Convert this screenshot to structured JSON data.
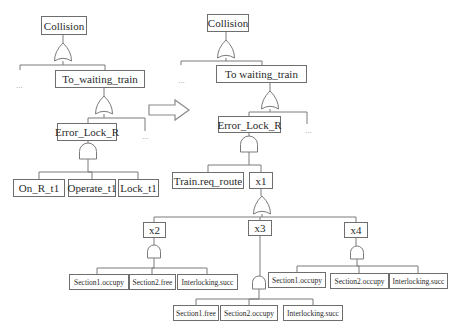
{
  "diagram": {
    "type": "fault-tree",
    "left_tree": {
      "top_event": "Collision",
      "intermediate_event": "To_waiting_train",
      "sub_event": "Error_Lock_R",
      "basic_events": [
        "On_R_t1",
        "Operate_t1",
        "Lock_t1"
      ],
      "ellipsis": "..."
    },
    "transform_arrow": "right-arrow",
    "right_tree": {
      "top_event": "Collision",
      "intermediate_event": "To waiting_train",
      "sub_event": "Error_Lock_R",
      "inputs": [
        "Train.req_route",
        "x1"
      ],
      "x1_children": [
        "x2",
        "x3",
        "x4"
      ],
      "x2_children": [
        "Section1.occupy",
        "Section2.free",
        "Interlocking.succ"
      ],
      "x3_children": [
        "Section1.free",
        "Section2.occupy",
        "Interlocking.succ"
      ],
      "x4_children": [
        "Section1.occupy",
        "Section2.occupy",
        "Interlocking.succ"
      ],
      "ellipsis": "..."
    }
  },
  "nodes": [
    {
      "id": "l-collision",
      "label": "Collision",
      "x": 41,
      "y": 16,
      "w": 46,
      "h": 19,
      "size": "big"
    },
    {
      "id": "l-to-waiting",
      "label": "To_waiting_train",
      "x": 55,
      "y": 70,
      "w": 90,
      "h": 18,
      "size": "big"
    },
    {
      "id": "l-error-lock",
      "label": "Error_Lock_R",
      "x": 57,
      "y": 123,
      "w": 60,
      "h": 18,
      "size": "big"
    },
    {
      "id": "l-on-r",
      "label": "On_R_t1",
      "x": 13,
      "y": 179,
      "w": 52,
      "h": 18,
      "size": "big"
    },
    {
      "id": "l-operate",
      "label": "Operate_t1",
      "x": 68,
      "y": 179,
      "w": 48,
      "h": 18,
      "size": "big"
    },
    {
      "id": "l-lock",
      "label": "Lock_t1",
      "x": 118,
      "y": 179,
      "w": 41,
      "h": 18,
      "size": "big"
    },
    {
      "id": "r-collision",
      "label": "Collision",
      "x": 207,
      "y": 14,
      "w": 42,
      "h": 18,
      "size": "big"
    },
    {
      "id": "r-to-waiting",
      "label": "To waiting_train",
      "x": 216,
      "y": 65,
      "w": 91,
      "h": 18,
      "size": "big"
    },
    {
      "id": "r-error-lock",
      "label": "Error_Lock_R",
      "x": 218,
      "y": 116,
      "w": 63,
      "h": 17,
      "size": "big"
    },
    {
      "id": "r-train-req",
      "label": "Train.req_route",
      "x": 172,
      "y": 172,
      "w": 72,
      "h": 17,
      "size": "big"
    },
    {
      "id": "r-x1",
      "label": "x1",
      "x": 249,
      "y": 172,
      "w": 24,
      "h": 17,
      "size": "big"
    },
    {
      "id": "r-x2",
      "label": "x2",
      "x": 143,
      "y": 222,
      "w": 23,
      "h": 16,
      "size": "big"
    },
    {
      "id": "r-x3",
      "label": "x3",
      "x": 248,
      "y": 220,
      "w": 24,
      "h": 16,
      "size": "big"
    },
    {
      "id": "r-x4",
      "label": "x4",
      "x": 344,
      "y": 222,
      "w": 24,
      "h": 16,
      "size": "big"
    },
    {
      "id": "x2-s1",
      "label": "Section1.occupy",
      "x": 69,
      "y": 274,
      "w": 60,
      "h": 16,
      "size": "small"
    },
    {
      "id": "x2-s2",
      "label": "Section2.free",
      "x": 129,
      "y": 274,
      "w": 47,
      "h": 16,
      "size": "small"
    },
    {
      "id": "x2-il",
      "label": "Interlocking.succ",
      "x": 177,
      "y": 274,
      "w": 61,
      "h": 16,
      "size": "small"
    },
    {
      "id": "x3-s1",
      "label": "Section1.free",
      "x": 173,
      "y": 305,
      "w": 46,
      "h": 16,
      "size": "small"
    },
    {
      "id": "x3-s2",
      "label": "Section2.occupy",
      "x": 220,
      "y": 305,
      "w": 58,
      "h": 16,
      "size": "small"
    },
    {
      "id": "x3-il",
      "label": "Interlocking.succ",
      "x": 283,
      "y": 305,
      "w": 60,
      "h": 16,
      "size": "small"
    },
    {
      "id": "x4-s1",
      "label": "Section1.occupy",
      "x": 268,
      "y": 272,
      "w": 58,
      "h": 16,
      "size": "small"
    },
    {
      "id": "x4-s2",
      "label": "Section2.occupy",
      "x": 330,
      "y": 273,
      "w": 59,
      "h": 16,
      "size": "small"
    },
    {
      "id": "x4-il",
      "label": "Interlocking.succ",
      "x": 389,
      "y": 273,
      "w": 59,
      "h": 16,
      "size": "small"
    }
  ],
  "gates": [
    {
      "id": "l-g1",
      "kind": "or",
      "cx": 63,
      "top": 43,
      "w": 17,
      "h": 18
    },
    {
      "id": "l-g2",
      "kind": "or",
      "cx": 104,
      "top": 96,
      "w": 17,
      "h": 18
    },
    {
      "id": "l-g3",
      "kind": "and",
      "cx": 88,
      "top": 143,
      "w": 17,
      "h": 16
    },
    {
      "id": "r-g1",
      "kind": "or",
      "cx": 226,
      "top": 40,
      "w": 17,
      "h": 18
    },
    {
      "id": "r-g2",
      "kind": "or",
      "cx": 270,
      "top": 91,
      "w": 17,
      "h": 18
    },
    {
      "id": "r-g3",
      "kind": "and",
      "cx": 249,
      "top": 136,
      "w": 17,
      "h": 16
    },
    {
      "id": "r-g4",
      "kind": "or",
      "cx": 262,
      "top": 196,
      "w": 17,
      "h": 18
    },
    {
      "id": "r-g5",
      "kind": "and",
      "cx": 154,
      "top": 245,
      "w": 13,
      "h": 13
    },
    {
      "id": "r-g6",
      "kind": "and",
      "cx": 259,
      "top": 276,
      "w": 13,
      "h": 13
    },
    {
      "id": "r-g7",
      "kind": "and",
      "cx": 357,
      "top": 246,
      "w": 13,
      "h": 13
    }
  ],
  "ellipses": [
    {
      "text": "...",
      "x": 16,
      "y": 80
    },
    {
      "text": "...",
      "x": 142,
      "y": 131
    },
    {
      "text": "...",
      "x": 178,
      "y": 75
    },
    {
      "text": "...",
      "x": 305,
      "y": 125
    }
  ],
  "colors": {
    "line": "#7a7a7a",
    "text": "#2a2a2a",
    "arrow": "#8a8a8a"
  }
}
